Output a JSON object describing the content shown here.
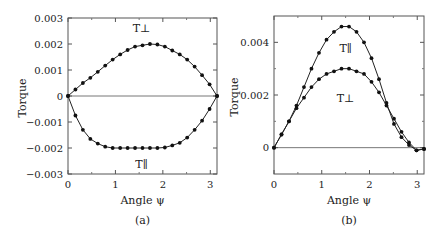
{
  "chart_data": [
    {
      "type": "line",
      "panel_label": "(a)",
      "title": "",
      "xlabel": "Angle ψ",
      "ylabel": "Torque",
      "xlim": [
        0,
        3.1416
      ],
      "ylim": [
        -0.003,
        0.003
      ],
      "xticks": [
        "0",
        "1",
        "2",
        "3"
      ],
      "yticks": [
        "0.003",
        "0.002",
        "0.001",
        "0",
        "−0.001",
        "−0.002",
        "−0.003"
      ],
      "grid": false,
      "series": [
        {
          "name": "T⊥",
          "label_pos": [
            1.55,
            0.0026
          ],
          "x": [
            0,
            0.157,
            0.314,
            0.471,
            0.628,
            0.785,
            0.942,
            1.1,
            1.257,
            1.414,
            1.571,
            1.728,
            1.885,
            2.042,
            2.199,
            2.356,
            2.513,
            2.67,
            2.827,
            2.985,
            3.142
          ],
          "values": [
            0,
            0.00025,
            0.0005,
            0.0007,
            0.00093,
            0.00117,
            0.0014,
            0.0016,
            0.00177,
            0.0019,
            0.00195,
            0.002,
            0.00198,
            0.0019,
            0.00175,
            0.0016,
            0.0014,
            0.00113,
            0.0008,
            0.00045,
            0
          ]
        },
        {
          "name": "T∥",
          "label_pos": [
            1.55,
            -0.0026
          ],
          "x": [
            0,
            0.157,
            0.314,
            0.471,
            0.628,
            0.785,
            0.942,
            1.1,
            1.257,
            1.414,
            1.571,
            1.728,
            1.885,
            2.042,
            2.199,
            2.356,
            2.513,
            2.67,
            2.827,
            2.985,
            3.142
          ],
          "values": [
            0,
            -0.00075,
            -0.0013,
            -0.00165,
            -0.00183,
            -0.00195,
            -0.002,
            -0.002,
            -0.002,
            -0.002,
            -0.002,
            -0.002,
            -0.002,
            -0.00198,
            -0.0019,
            -0.0018,
            -0.0016,
            -0.0013,
            -0.00095,
            -0.0005,
            0
          ]
        }
      ]
    },
    {
      "type": "line",
      "panel_label": "(b)",
      "title": "",
      "xlabel": "Angle ψ",
      "ylabel": "Torque",
      "xlim": [
        0,
        3.1416
      ],
      "ylim": [
        -0.001,
        0.005
      ],
      "xticks": [
        "0",
        "1",
        "2",
        "3"
      ],
      "yticks": [
        "0.004",
        "0.002",
        "0"
      ],
      "grid": false,
      "series": [
        {
          "name": "T∥",
          "label_pos": [
            1.5,
            0.0038
          ],
          "x": [
            0,
            0.157,
            0.314,
            0.471,
            0.628,
            0.785,
            0.942,
            1.1,
            1.257,
            1.414,
            1.571,
            1.728,
            1.885,
            2.042,
            2.199,
            2.356,
            2.513,
            2.67,
            2.827,
            2.985,
            3.142
          ],
          "values": [
            0,
            0.0005,
            0.001,
            0.0016,
            0.0023,
            0.003,
            0.0036,
            0.0041,
            0.0044,
            0.0046,
            0.0046,
            0.0044,
            0.004,
            0.0034,
            0.0026,
            0.0017,
            0.0009,
            0.0004,
            0.0001,
            -0.0001,
            -5e-05
          ]
        },
        {
          "name": "T⊥",
          "label_pos": [
            1.5,
            0.0019
          ],
          "x": [
            0,
            0.157,
            0.314,
            0.471,
            0.628,
            0.785,
            0.942,
            1.1,
            1.257,
            1.414,
            1.571,
            1.728,
            1.885,
            2.042,
            2.199,
            2.356,
            2.513,
            2.67,
            2.827,
            2.985,
            3.142
          ],
          "values": [
            0,
            0.0005,
            0.001,
            0.0015,
            0.0019,
            0.0023,
            0.0026,
            0.0028,
            0.0029,
            0.003,
            0.003,
            0.0029,
            0.0028,
            0.0025,
            0.0021,
            0.0016,
            0.0011,
            0.0006,
            0.0002,
            -0.0001,
            -5e-05
          ]
        }
      ]
    }
  ]
}
